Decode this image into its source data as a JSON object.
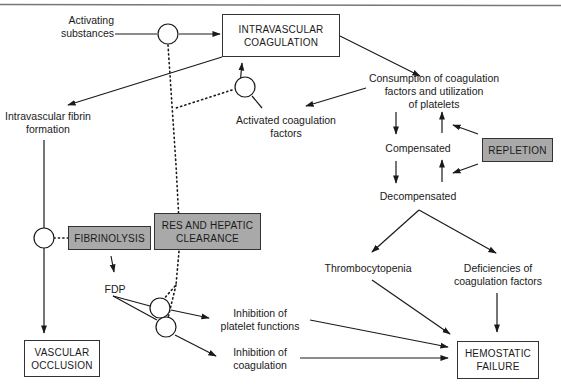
{
  "colors": {
    "line": "#1a1a1a",
    "gray_box": "#a9a9a9",
    "white_box": "#ffffff",
    "border": "#333333"
  },
  "boxes": {
    "intravascular_coagulation": [
      "INTRAVASCULAR",
      "COAGULATION"
    ],
    "repletion": [
      "REPLETION"
    ],
    "fibrinolysis": [
      "FIBRINOLYSIS"
    ],
    "res_hepatic": [
      "RES AND HEPATIC",
      "CLEARANCE"
    ],
    "vascular_occlusion": [
      "VASCULAR",
      "OCCLUSION"
    ],
    "hemostatic_failure": [
      "HEMOSTATIC",
      "FAILURE"
    ]
  },
  "labels": {
    "activating_substances": [
      "Activating",
      "substances"
    ],
    "intravascular_fibrin": [
      "Intravascular fibrin",
      "formation"
    ],
    "activated_factors": [
      "Activated coagulation",
      "factors"
    ],
    "consumption": [
      "Consumption of coagulation",
      "factors and utilization",
      "of platelets"
    ],
    "compensated": [
      "Compensated"
    ],
    "decompensated": [
      "Decompensated"
    ],
    "thrombocytopenia": [
      "Thrombocytopenia"
    ],
    "deficiencies": [
      "Deficiencies of",
      "coagulation factors"
    ],
    "fdp": [
      "FDP"
    ],
    "inhibition_platelet": [
      "Inhibition of",
      "platelet functions"
    ],
    "inhibition_coagulation": [
      "Inhibition of",
      "coagulation"
    ]
  }
}
